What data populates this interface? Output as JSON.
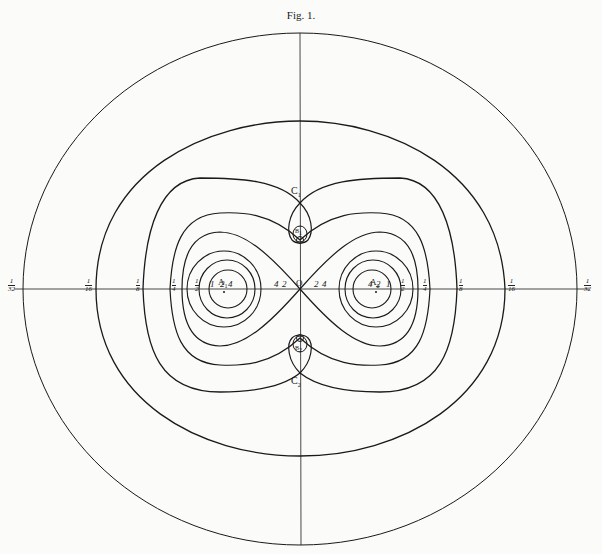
{
  "figure": {
    "title": "Fig. 1.",
    "points": {
      "A1": "A",
      "A1_sub": "1",
      "A2": "A",
      "A2_sub": "2",
      "B1": "B",
      "B1_sub": "1",
      "B2": "B",
      "B2_sub": "2",
      "C1": "C",
      "C1_sub": "1",
      "C2": "C",
      "C2_sub": "2",
      "O": "O"
    },
    "inner_labels_left": [
      "1",
      "2",
      "4",
      "4",
      "2"
    ],
    "inner_labels_right": [
      "2",
      "4",
      "4",
      "2",
      "1"
    ],
    "fractions_left": [
      {
        "num": "1",
        "den": "32"
      },
      {
        "num": "1",
        "den": "16"
      },
      {
        "num": "1",
        "den": "8"
      },
      {
        "num": "1",
        "den": "4"
      },
      {
        "num": "1",
        "den": "2"
      }
    ],
    "fractions_right": [
      {
        "num": "1",
        "den": "2"
      },
      {
        "num": "1",
        "den": "4"
      },
      {
        "num": "1",
        "den": "8"
      },
      {
        "num": "1",
        "den": "16"
      },
      {
        "num": "1",
        "den": "32"
      }
    ],
    "colors": {
      "line": "#1a1a1a",
      "paper": "#fbfbf9"
    }
  }
}
